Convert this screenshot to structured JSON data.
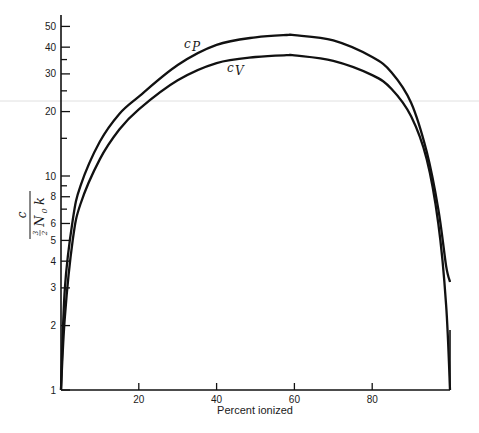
{
  "chart_data": {
    "type": "line",
    "title": "",
    "xlabel": "Percent ionized",
    "ylabel": "c / (3/2 N0 k)",
    "ylabel_parts": {
      "numerator": "c",
      "frac_num": "3",
      "frac_den": "2",
      "symbol": "N",
      "subscript": "0",
      "trailing": "k"
    },
    "yscale": "log",
    "xlim": [
      0,
      100
    ],
    "ylim": [
      1,
      55
    ],
    "grid": false,
    "x_ticks": [
      {
        "value": 20,
        "label": "20"
      },
      {
        "value": 40,
        "label": "40"
      },
      {
        "value": 60,
        "label": "60"
      },
      {
        "value": 80,
        "label": "80"
      }
    ],
    "y_ticks": [
      {
        "value": 1,
        "label": "1"
      },
      {
        "value": 2,
        "label": "2"
      },
      {
        "value": 3,
        "label": "3"
      },
      {
        "value": 4,
        "label": "4"
      },
      {
        "value": 5,
        "label": "5"
      },
      {
        "value": 6,
        "label": "6"
      },
      {
        "value": 7,
        "label": ""
      },
      {
        "value": 8,
        "label": "8"
      },
      {
        "value": 9,
        "label": ""
      },
      {
        "value": 10,
        "label": "10"
      },
      {
        "value": 15,
        "label": ""
      },
      {
        "value": 20,
        "label": "20"
      },
      {
        "value": 25,
        "label": ""
      },
      {
        "value": 30,
        "label": "30"
      },
      {
        "value": 35,
        "label": ""
      },
      {
        "value": 40,
        "label": "40"
      },
      {
        "value": 50,
        "label": "50"
      }
    ],
    "x": [
      0,
      1,
      3,
      5,
      10,
      15,
      20,
      30,
      40,
      50,
      58,
      60,
      70,
      80,
      85,
      90,
      94,
      97,
      99,
      100
    ],
    "series": [
      {
        "name": "cP",
        "label_main": "c",
        "label_sub": "P",
        "values": [
          1.0,
          3.0,
          6.2,
          9.0,
          14.5,
          19.5,
          23.5,
          33.0,
          41.0,
          44.5,
          45.6,
          45.5,
          43.0,
          36.0,
          30.5,
          22.0,
          13.0,
          7.0,
          3.8,
          3.2
        ]
      },
      {
        "name": "cV",
        "label_main": "c",
        "label_sub": "V",
        "values": [
          1.0,
          2.2,
          5.0,
          7.4,
          12.0,
          16.5,
          20.5,
          28.0,
          33.7,
          36.0,
          36.7,
          36.6,
          34.5,
          29.6,
          25.5,
          19.0,
          12.0,
          6.0,
          2.5,
          1.0
        ]
      }
    ],
    "annotations": [
      {
        "text": "cP",
        "near_x": 35,
        "near_y": 40
      },
      {
        "text": "cV",
        "near_x": 50,
        "near_y": 30
      }
    ]
  }
}
